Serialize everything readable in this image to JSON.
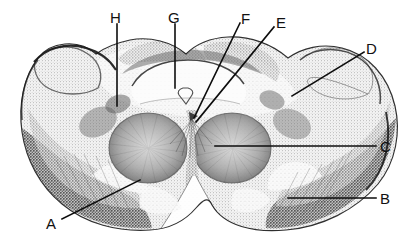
{
  "figure": {
    "kind": "labeled-histology-micrograph",
    "width": 410,
    "height": 246,
    "background_color": "#ffffff",
    "ink_color": "#111111",
    "stain_dark": "#3a3a3a",
    "stain_mid": "#8d8d8d",
    "stain_light": "#d8d8d8"
  },
  "labels": [
    {
      "id": "label-a",
      "letter": "A",
      "text_x": 46,
      "text_y": 216,
      "leader": [
        [
          62,
          219
        ],
        [
          140,
          180
        ]
      ]
    },
    {
      "id": "label-b",
      "letter": "B",
      "text_x": 380,
      "text_y": 191,
      "leader": [
        [
          376,
          198
        ],
        [
          288,
          198
        ]
      ]
    },
    {
      "id": "label-c",
      "letter": "C",
      "text_x": 380,
      "text_y": 139,
      "leader": [
        [
          376,
          146
        ],
        [
          215,
          146
        ]
      ]
    },
    {
      "id": "label-d",
      "letter": "D",
      "text_x": 366,
      "text_y": 41,
      "leader": [
        [
          364,
          52
        ],
        [
          292,
          96
        ]
      ]
    },
    {
      "id": "label-e",
      "letter": "E",
      "text_x": 276,
      "text_y": 15,
      "leader": [
        [
          274,
          27
        ],
        [
          196,
          122
        ]
      ]
    },
    {
      "id": "label-f",
      "letter": "F",
      "text_x": 241,
      "text_y": 11,
      "leader": [
        [
          240,
          23
        ],
        [
          194,
          118
        ]
      ]
    },
    {
      "id": "label-g",
      "letter": "G",
      "text_x": 168,
      "text_y": 10,
      "leader": [
        [
          175,
          24
        ],
        [
          175,
          88
        ]
      ]
    },
    {
      "id": "label-h",
      "letter": "H",
      "text_x": 110,
      "text_y": 10,
      "leader": [
        [
          117,
          24
        ],
        [
          117,
          106
        ]
      ]
    }
  ]
}
